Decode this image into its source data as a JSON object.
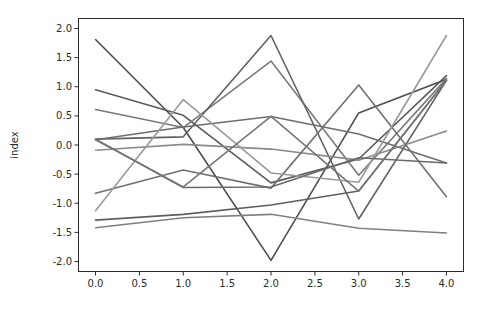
{
  "chart_data": {
    "type": "line",
    "title": "",
    "xlabel": "",
    "ylabel": "index",
    "x": [
      0.0,
      1.0,
      2.0,
      3.0,
      4.0
    ],
    "xlim": [
      -0.2,
      4.2
    ],
    "ylim": [
      -2.18,
      2.18
    ],
    "xticks": [
      0.0,
      0.5,
      1.0,
      1.5,
      2.0,
      2.5,
      3.0,
      3.5,
      4.0
    ],
    "xtick_labels": [
      "0.0",
      "0.5",
      "1.0",
      "1.5",
      "2.0",
      "2.5",
      "3.0",
      "3.5",
      "4.0"
    ],
    "yticks": [
      -2.0,
      -1.5,
      -1.0,
      -0.5,
      0.0,
      0.5,
      1.0,
      1.5,
      2.0
    ],
    "ytick_labels": [
      "-2.0",
      "-1.5",
      "-1.0",
      "-0.5",
      "0.0",
      "0.5",
      "1.0",
      "1.5",
      "2.0"
    ],
    "grid": false,
    "legend": "none",
    "background": "#ffffff",
    "axis_color": "#2b2b2b",
    "series": [
      {
        "name": "series-1",
        "color": "#4d4d4d",
        "values": [
          1.81,
          0.3,
          -1.98,
          0.55,
          1.13
        ]
      },
      {
        "name": "series-2",
        "color": "#5a5a5a",
        "values": [
          0.95,
          0.51,
          -0.65,
          -0.24,
          1.19
        ]
      },
      {
        "name": "series-3",
        "color": "#7a7a7a",
        "values": [
          0.61,
          0.3,
          1.44,
          -0.52,
          1.14
        ]
      },
      {
        "name": "series-4",
        "color": "#616161",
        "values": [
          0.1,
          0.14,
          1.88,
          -1.27,
          1.11
        ]
      },
      {
        "name": "series-5",
        "color": "#6e6e6e",
        "values": [
          0.09,
          0.31,
          0.49,
          0.19,
          -0.31
        ]
      },
      {
        "name": "series-6",
        "color": "#8a8a8a",
        "values": [
          -0.09,
          0.01,
          -0.07,
          -0.26,
          0.24
        ]
      },
      {
        "name": "series-7",
        "color": "#717171",
        "values": [
          -0.83,
          -0.43,
          -0.74,
          1.03,
          -0.89
        ]
      },
      {
        "name": "series-8",
        "color": "#5e5e5e",
        "values": [
          -1.29,
          -1.19,
          -1.03,
          -0.79,
          1.11
        ]
      },
      {
        "name": "series-9",
        "color": "#808080",
        "values": [
          -1.42,
          -1.25,
          -1.19,
          -1.43,
          -1.51
        ]
      },
      {
        "name": "series-10",
        "color": "#9a9a9a",
        "values": [
          -1.13,
          0.78,
          -0.48,
          -0.64,
          1.88
        ]
      },
      {
        "name": "series-11",
        "color": "#6a6a6a",
        "values": [
          0.1,
          -0.73,
          -0.72,
          -0.22,
          -0.31
        ]
      },
      {
        "name": "series-12",
        "color": "#767676",
        "values": [
          0.09,
          -0.72,
          0.49,
          -0.79,
          1.11
        ]
      }
    ]
  },
  "figure": {
    "width": 479,
    "height": 312,
    "axes_box": {
      "left": 78,
      "top": 18,
      "right": 464,
      "bottom": 272
    }
  }
}
